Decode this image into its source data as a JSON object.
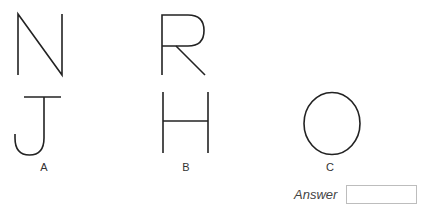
{
  "question": {
    "pattern_letters": [
      "N",
      "R"
    ],
    "options": [
      {
        "label": "A",
        "letter": "J"
      },
      {
        "label": "B",
        "letter": "H"
      },
      {
        "label": "C",
        "letter": "O"
      }
    ]
  },
  "answer": {
    "label": "Answer",
    "value": ""
  },
  "colors": {
    "stroke": "#222222",
    "box_border": "#bdbdbd"
  }
}
